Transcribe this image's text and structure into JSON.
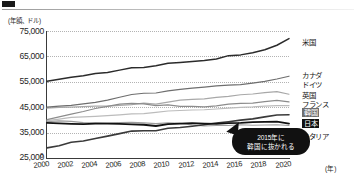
{
  "header": {
    "marker_icon": "black-square-marker",
    "rule_icon": "horizontal-rule"
  },
  "chart_data": {
    "type": "line",
    "title": "",
    "subtitle": "",
    "xlabel": "(年)",
    "ylabel": "(年額、ドル)",
    "unit_caption": "(年額、ドル)",
    "x_unit_label": "(年)",
    "zero_label": "0",
    "xlim": [
      2000,
      2020
    ],
    "ylim": [
      25000,
      75000
    ],
    "grid": "horizontal-dotted",
    "legend_position": "right",
    "x": [
      2000,
      2001,
      2002,
      2003,
      2004,
      2005,
      2006,
      2007,
      2008,
      2009,
      2010,
      2011,
      2012,
      2013,
      2014,
      2015,
      2016,
      2017,
      2018,
      2019,
      2020
    ],
    "xtick_labels": [
      "2000",
      "2002",
      "2004",
      "2006",
      "2008",
      "2010",
      "2012",
      "2014",
      "2016",
      "2018",
      "2020"
    ],
    "xticks": [
      2000,
      2002,
      2004,
      2006,
      2008,
      2010,
      2012,
      2014,
      2016,
      2018,
      2020
    ],
    "ytick_labels": [
      "75,000",
      "65,000",
      "55,000",
      "45,000",
      "35,000",
      "25,000"
    ],
    "yticks": [
      75000,
      65000,
      55000,
      45000,
      35000,
      25000
    ],
    "series": [
      {
        "name": "米国",
        "key": "usa",
        "color": "#2b2b2b",
        "width": 1.5,
        "values": [
          55200,
          56000,
          56800,
          57400,
          58300,
          58700,
          59600,
          60500,
          60600,
          61300,
          62300,
          62600,
          63000,
          63400,
          64000,
          65300,
          65600,
          66400,
          67600,
          69400,
          72000
        ]
      },
      {
        "name": "カナダ",
        "key": "canada",
        "color": "#6e6e6e",
        "width": 1.2,
        "values": [
          45000,
          45400,
          45700,
          46300,
          46900,
          47800,
          48900,
          50000,
          50500,
          50600,
          51400,
          52000,
          52500,
          52900,
          53400,
          53700,
          53900,
          54500,
          55200,
          56100,
          57200
        ]
      },
      {
        "name": "ドイツ",
        "key": "germany",
        "color": "#a8a8a8",
        "width": 1.2,
        "values": [
          44600,
          44900,
          45000,
          45200,
          45400,
          45400,
          45700,
          46000,
          46600,
          46200,
          47000,
          47800,
          48100,
          48300,
          48900,
          49300,
          49900,
          50200,
          50700,
          51100,
          50100
        ]
      },
      {
        "name": "英国",
        "key": "uk",
        "color": "#8c8c8c",
        "width": 1.2,
        "values": [
          40100,
          41200,
          42300,
          43300,
          44500,
          45300,
          46200,
          46500,
          46300,
          45600,
          45900,
          45300,
          45300,
          45100,
          45500,
          46200,
          46500,
          46600,
          47200,
          47700,
          47100
        ]
      },
      {
        "name": "フランス",
        "key": "france",
        "color": "#bcbcbc",
        "width": 1.2,
        "values": [
          39700,
          40300,
          41000,
          41200,
          41400,
          41700,
          42000,
          42400,
          42500,
          43000,
          43500,
          43700,
          43900,
          44000,
          44300,
          44600,
          44900,
          45100,
          45400,
          45600,
          45600
        ]
      },
      {
        "name": "韓国",
        "key": "korea",
        "color": "#3a3a3a",
        "width": 1.6,
        "highlight": "gray",
        "values": [
          29000,
          29800,
          31200,
          31700,
          32700,
          33600,
          34600,
          35600,
          35700,
          35700,
          36700,
          37000,
          37500,
          38100,
          38800,
          39300,
          39900,
          40400,
          41200,
          41900,
          42000
        ]
      },
      {
        "name": "日本",
        "key": "japan",
        "color": "#111111",
        "width": 1.8,
        "highlight": "black",
        "values": [
          38800,
          38600,
          38400,
          38300,
          38500,
          38500,
          38400,
          38200,
          38100,
          37600,
          38300,
          38500,
          38700,
          38500,
          38400,
          38700,
          38800,
          39100,
          39200,
          39300,
          38500
        ]
      },
      {
        "name": "イタリア",
        "key": "italy",
        "color": "#9c9c9c",
        "width": 1.2,
        "values": [
          39300,
          39600,
          39400,
          38900,
          38800,
          38700,
          38900,
          39000,
          38800,
          38500,
          38800,
          38600,
          38000,
          37600,
          37800,
          37800,
          38100,
          37900,
          38000,
          38100,
          37800
        ]
      }
    ],
    "annotations": [
      {
        "name": "korea-overtake-callout",
        "line1": "2015年に",
        "line2": "韓国に抜かれる",
        "target_year": 2015
      }
    ]
  }
}
